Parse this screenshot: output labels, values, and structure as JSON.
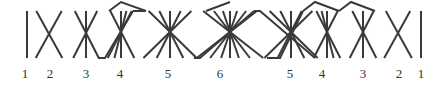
{
  "diagram": {
    "stroke_color": "#3a3a3a",
    "background": "#ffffff",
    "top_y": 11,
    "bottom_y": 58,
    "label_y": 78,
    "groups": [
      {
        "label": "1",
        "cx": 27,
        "cy": 34,
        "label_x": 25,
        "offsets": [
          0
        ]
      },
      {
        "label": "2",
        "cx": 49,
        "cy": 34,
        "label_x": 50,
        "offsets": [
          -13,
          13
        ]
      },
      {
        "label": "3",
        "cx": 86,
        "cy": 33,
        "label_x": 86,
        "offsets": [
          -12,
          0,
          12
        ]
      },
      {
        "label": "4",
        "cx": 121,
        "cy": 32,
        "label_x": 120,
        "offsets": [
          -12,
          -6,
          0,
          12
        ]
      },
      {
        "label": "5",
        "cx": 170,
        "cy": 32,
        "label_x": 168,
        "offsets": [
          -24,
          -12,
          0,
          12,
          24
        ]
      },
      {
        "label": "6",
        "cx": 230,
        "cy": 32,
        "label_x": 220,
        "offsets": [
          -30,
          -18,
          -8,
          0,
          8,
          18,
          30
        ]
      },
      {
        "label": "5",
        "cx": 291,
        "cy": 32,
        "label_x": 290,
        "offsets": [
          -24,
          -12,
          0,
          12,
          24
        ]
      },
      {
        "label": "4",
        "cx": 327,
        "cy": 32,
        "label_x": 322,
        "offsets": [
          -12,
          0,
          6,
          12
        ]
      },
      {
        "label": "3",
        "cx": 363,
        "cy": 32,
        "label_x": 363,
        "offsets": [
          -12,
          0,
          12
        ]
      },
      {
        "label": "2",
        "cx": 398,
        "cy": 33,
        "label_x": 399,
        "offsets": [
          -13,
          13
        ]
      },
      {
        "label": "1",
        "cx": 421,
        "cy": 34,
        "label_x": 421,
        "offsets": [
          0
        ]
      }
    ],
    "connectors": [
      [
        [
          98,
          58
        ],
        [
          105,
          58
        ],
        [
          133,
          11
        ]
      ],
      [
        [
          133,
          11
        ],
        [
          146,
          11
        ]
      ],
      [
        [
          109,
          11
        ],
        [
          121,
          2
        ],
        [
          146,
          11
        ]
      ],
      [
        [
          194,
          58
        ],
        [
          200,
          58
        ],
        [
          254,
          11
        ]
      ],
      [
        [
          206,
          11
        ],
        [
          230,
          2
        ]
      ],
      [
        [
          254,
          11
        ],
        [
          260,
          11
        ],
        [
          315,
          58
        ]
      ],
      [
        [
          267,
          58
        ],
        [
          280,
          58
        ],
        [
          303,
          11
        ]
      ],
      [
        [
          303,
          11
        ],
        [
          315,
          2
        ],
        [
          339,
          11
        ]
      ],
      [
        [
          339,
          11
        ],
        [
          351,
          2
        ],
        [
          375,
          11
        ]
      ]
    ]
  }
}
